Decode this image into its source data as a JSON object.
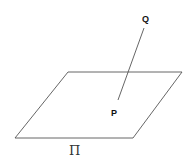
{
  "diagram": {
    "plane": {
      "label": "Π",
      "vertices": [
        [
          68,
          72
        ],
        [
          182,
          72
        ],
        [
          133,
          138
        ],
        [
          15,
          138
        ]
      ],
      "stroke": "#555555"
    },
    "segment": {
      "from": "Q",
      "to": "P",
      "stroke": "#555555"
    },
    "points": [
      {
        "name": "Q",
        "label": "Q",
        "x": 144,
        "y": 28
      },
      {
        "name": "P",
        "label": "P",
        "x": 118,
        "y": 100
      }
    ]
  }
}
